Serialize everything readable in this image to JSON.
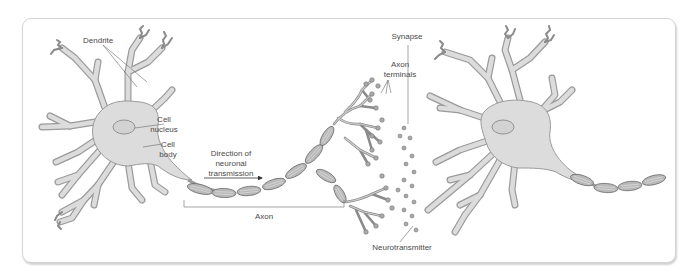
{
  "labels": {
    "dendrite": "Dendrite",
    "cell_nucleus_1": "Cell",
    "cell_nucleus_2": "nucleus",
    "cell_body_1": "Cell",
    "cell_body_2": "body",
    "direction_1": "Direction of",
    "direction_2": "neuronal",
    "direction_3": "transmission",
    "axon": "Axon",
    "axon_terminals_1": "Axon",
    "axon_terminals_2": "terminals",
    "synapse": "Synapse",
    "neurotransmitter": "Neurotransmitter"
  },
  "colors": {
    "card_background": "#ffffff",
    "card_border": "#d4d4d4",
    "cell_fill": "#dcdcdc",
    "cell_outline": "#9a9a9a",
    "myelin": "#b9b9b9",
    "label_text": "#4a4a4a"
  }
}
